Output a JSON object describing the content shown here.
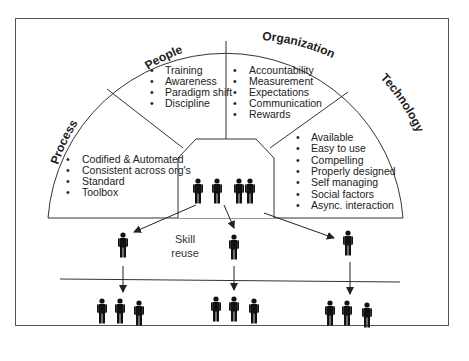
{
  "diagram": {
    "categories": [
      {
        "id": "process",
        "title": "Process",
        "items": [
          "Codified & Automated",
          "Consistent across org's",
          "Standard",
          "Toolbox"
        ]
      },
      {
        "id": "people",
        "title": "People",
        "items": [
          "Training",
          "Awareness",
          "Paradigm shift",
          "Discipline"
        ]
      },
      {
        "id": "organization",
        "title": "Organization",
        "items": [
          "Accountability",
          "Measurement",
          "Expectations",
          "Communication",
          "Rewards"
        ]
      },
      {
        "id": "technology",
        "title": "Technology",
        "items": [
          "Available",
          "Easy to use",
          "Compelling",
          "Properly designed",
          "Self managing",
          "Social factors",
          "Async. interaction"
        ]
      }
    ],
    "center_group": {
      "people_count": 4
    },
    "middle_label": {
      "line1": "Skill",
      "line2": "reuse"
    },
    "branches": [
      {
        "id": "left",
        "mid_person": 1,
        "team_size": 3
      },
      {
        "id": "center",
        "mid_person": 1,
        "team_size": 3
      },
      {
        "id": "right",
        "mid_person": 1,
        "team_size": 3
      }
    ],
    "colors": {
      "line": "#333333",
      "figure": "#111111",
      "frame": "#555555"
    }
  }
}
